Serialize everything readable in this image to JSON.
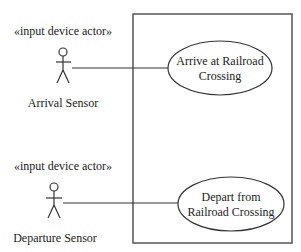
{
  "diagram": {
    "type": "uml-use-case",
    "system_boundary": {
      "x": 133,
      "y": 14,
      "width": 159,
      "height": 229
    },
    "actors": [
      {
        "id": "arrival-sensor",
        "stereotype": "«input device actor»",
        "name": "Arrival Sensor",
        "x": 63,
        "y": 52
      },
      {
        "id": "departure-sensor",
        "stereotype": "«input device actor»",
        "name": "Departure Sensor",
        "x": 54,
        "y": 187
      }
    ],
    "use_cases": [
      {
        "id": "arrive",
        "lines": [
          "Arrive at Railroad",
          "Crossing"
        ],
        "cx": 220,
        "cy": 68,
        "rx": 52,
        "ry": 27
      },
      {
        "id": "depart",
        "lines": [
          "Depart from",
          "Railroad Crossing"
        ],
        "cx": 231,
        "cy": 204,
        "rx": 53,
        "ry": 27
      }
    ],
    "associations": [
      {
        "from": "arrival-sensor",
        "to": "arrive"
      },
      {
        "from": "departure-sensor",
        "to": "depart"
      }
    ]
  }
}
